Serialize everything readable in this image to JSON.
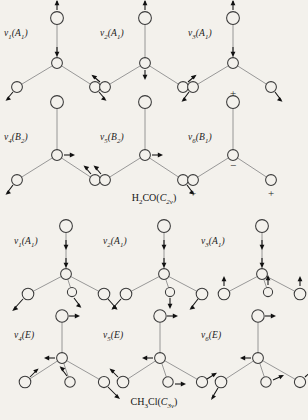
{
  "figure": {
    "background_color": "#f3f1ec",
    "atom_fill": "#f3f1ec",
    "atom_stroke": "#3a3a3a",
    "bond_color": "#8d8d8d",
    "arrow_color": "#111111"
  },
  "molecules": [
    {
      "id": "h2co",
      "caption_prefix": "H",
      "caption_sub1": "2",
      "caption_mid": "CO(",
      "caption_point_group": "C",
      "caption_pg_sub": "2v",
      "caption_suffix": ")",
      "caption_full": "H2CO(C2v)"
    },
    {
      "id": "ch3cl",
      "caption_prefix": "CH",
      "caption_sub1": "3",
      "caption_mid": "Cl(",
      "caption_point_group": "C",
      "caption_pg_sub": "3v",
      "caption_suffix": ")",
      "caption_full": "CH3Cl(C3v)"
    }
  ],
  "panels": [
    {
      "name": "h2co-v1",
      "nu": "ν",
      "index": "1",
      "symmetry": "(A",
      "sym_sub": "1",
      "sym_close": ")"
    },
    {
      "name": "h2co-v2",
      "nu": "ν",
      "index": "2",
      "symmetry": "(A",
      "sym_sub": "1",
      "sym_close": ")"
    },
    {
      "name": "h2co-v3",
      "nu": "ν",
      "index": "3",
      "symmetry": "(A",
      "sym_sub": "1",
      "sym_close": ")"
    },
    {
      "name": "h2co-v4",
      "nu": "ν",
      "index": "4",
      "symmetry": "(B",
      "sym_sub": "2",
      "sym_close": ")"
    },
    {
      "name": "h2co-v5",
      "nu": "ν",
      "index": "5",
      "symmetry": "(B",
      "sym_sub": "2",
      "sym_close": ")"
    },
    {
      "name": "h2co-v6",
      "nu": "ν",
      "index": "6",
      "symmetry": "(B",
      "sym_sub": "1",
      "sym_close": ")"
    },
    {
      "name": "ch3cl-v1",
      "nu": "ν",
      "index": "1",
      "symmetry": "(A",
      "sym_sub": "1",
      "sym_close": ")"
    },
    {
      "name": "ch3cl-v2",
      "nu": "ν",
      "index": "2",
      "symmetry": "(A",
      "sym_sub": "1",
      "sym_close": ")"
    },
    {
      "name": "ch3cl-v3",
      "nu": "ν",
      "index": "3",
      "symmetry": "(A",
      "sym_sub": "1",
      "sym_close": ")"
    },
    {
      "name": "ch3cl-v4",
      "nu": "ν",
      "index": "4",
      "symmetry": "(E",
      "sym_sub": "",
      "sym_close": ")"
    },
    {
      "name": "ch3cl-v5",
      "nu": "ν",
      "index": "5",
      "symmetry": "(E",
      "sym_sub": "",
      "sym_close": ")"
    },
    {
      "name": "ch3cl-v6",
      "nu": "ν",
      "index": "6",
      "symmetry": "(E",
      "sym_sub": "",
      "sym_close": ")"
    }
  ],
  "signs": {
    "plus": "+",
    "minus": "−"
  },
  "out_of_plane_signs": [
    {
      "panel": "h2co-v6",
      "label": "+",
      "position": "above-oxygen"
    },
    {
      "panel": "h2co-v6",
      "label": "−",
      "position": "at-carbon"
    },
    {
      "panel": "h2co-v6",
      "label": "+",
      "position": "below-left-hydrogen"
    },
    {
      "panel": "h2co-v6",
      "label": "+",
      "position": "below-right-hydrogen"
    }
  ]
}
